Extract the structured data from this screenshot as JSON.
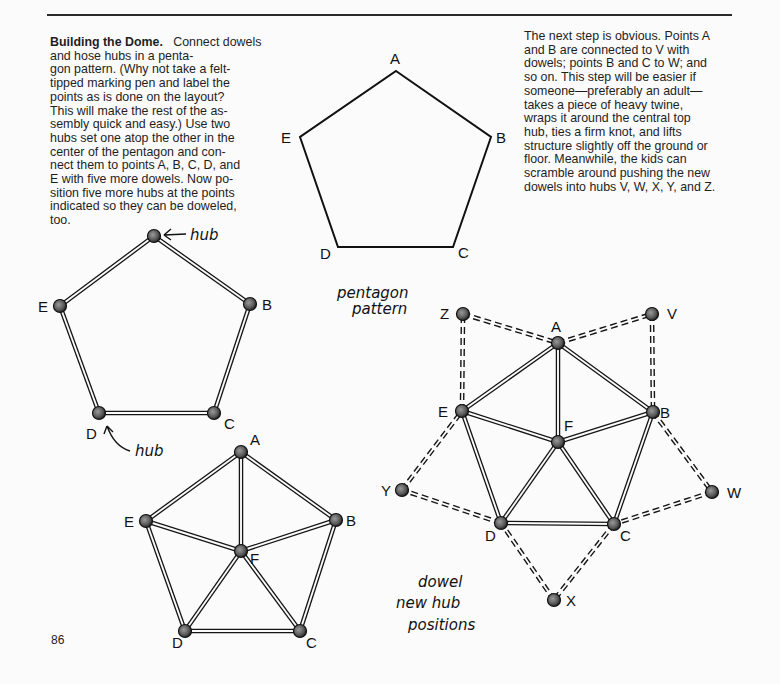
{
  "page": {
    "page_number": "86",
    "left_paragraph": {
      "heading": "Building the Dome.",
      "body": "Connect dowels and hose hubs in a penta-\ngon pattern. (Why not take a felt-\ntipped marking pen and label the\npoints as is done on the layout?\nThis will make the rest of the as-\nsembly quick and easy.) Use two\nhubs set one atop the other in the\ncenter of the pentagon and con-\nnect them to points A, B, C, D, and\nE with five more dowels. Now po-\nsition five more hubs at the points\nindicated so they can be doweled,\ntoo."
    },
    "right_paragraph": "The next step is obvious. Points A\nand B are connected to V with\ndowels; points B and C to W; and\nso on. This step will be easier if\nsomeone—preferably an adult—\ntakes a piece of heavy twine,\nwraps it around the central top\nhub, ties a firm knot, and lifts\nstructure slightly off the ground or\nfloor. Meanwhile, the kids can\nscramble around pushing the new\ndowels into hubs V, W, X, Y, and Z."
  },
  "figures": {
    "pentagon_pattern": {
      "caption_line1": "pentagon",
      "caption_line2": "pattern",
      "points": [
        "A",
        "B",
        "C",
        "D",
        "E"
      ]
    },
    "hub_pentagon": {
      "hub_note_top": "hub",
      "hub_note_bottom": "hub",
      "labels": [
        "E",
        "B",
        "C",
        "D"
      ]
    },
    "center_hub_pentagon": {
      "labels": [
        "A",
        "B",
        "C",
        "D",
        "E",
        "F"
      ]
    },
    "new_hub_positions": {
      "caption_line1": "dowel",
      "caption_line2": "new hub",
      "caption_line3": "positions",
      "labels": [
        "A",
        "B",
        "C",
        "D",
        "E",
        "F",
        "V",
        "W",
        "X",
        "Y",
        "Z"
      ]
    }
  }
}
